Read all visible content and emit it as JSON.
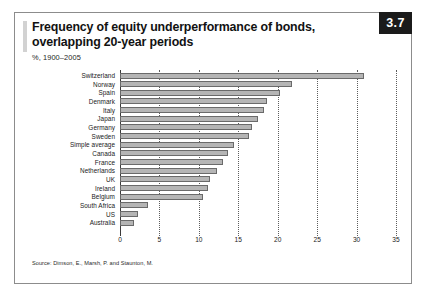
{
  "figure": {
    "badge": "3.7",
    "title": "Frequency of equity underperformance of bonds, overlapping 20-year periods",
    "subtitle": "%, 1900–2005",
    "source": "Source: Dimson, E., Marsh, P. and Staunton, M.",
    "colors": {
      "bar_fill": "#b5b5b5",
      "bar_border": "#6a6a6a",
      "badge_bg": "#1b1b1b",
      "frame": "#8c8c8c"
    }
  },
  "chart_data": {
    "type": "bar",
    "orientation": "horizontal",
    "title": "Frequency of equity underperformance of bonds, overlapping 20-year periods",
    "subtitle": "%, 1900–2005",
    "xlabel": "",
    "ylabel": "",
    "xlim": [
      0,
      35
    ],
    "xticks": [
      0,
      5,
      10,
      15,
      20,
      25,
      30,
      35
    ],
    "grid": true,
    "grid_axis": "x",
    "legend": false,
    "categories": [
      "Switzerland",
      "Norway",
      "Spain",
      "Denmark",
      "Italy",
      "Japan",
      "Germany",
      "Sweden",
      "Simple average",
      "Canada",
      "France",
      "Netherlands",
      "UK",
      "Ireland",
      "Belgium",
      "South Africa",
      "US",
      "Australia"
    ],
    "values": [
      31.0,
      21.8,
      20.3,
      18.6,
      18.3,
      17.5,
      16.8,
      16.4,
      14.5,
      13.7,
      13.1,
      12.3,
      11.4,
      11.2,
      10.5,
      3.5,
      2.3,
      1.8
    ]
  }
}
